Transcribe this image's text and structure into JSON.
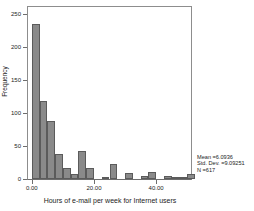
{
  "chart_data": {
    "type": "bar",
    "title": "",
    "subtitle": "",
    "xlabel": "Hours of e-mail per week for Internet users",
    "ylabel": "Frequency",
    "xlim": [
      -1.25,
      51.25
    ],
    "ylim": [
      0,
      260
    ],
    "grid": false,
    "legend": null,
    "bin_width": 2.5,
    "x_tick_labels": [
      "0.00",
      "20.00",
      "40.00"
    ],
    "x_tick_values": [
      0,
      20,
      40
    ],
    "y_tick_labels": [
      "0",
      "50",
      "100",
      "150",
      "200",
      "250"
    ],
    "y_tick_values": [
      0,
      50,
      100,
      150,
      200,
      250
    ],
    "categories": [
      "0.0",
      "2.5",
      "5.0",
      "7.5",
      "10.0",
      "12.5",
      "15.0",
      "17.5",
      "20.0",
      "22.5",
      "25.0",
      "27.5",
      "30.0",
      "32.5",
      "35.0",
      "37.5",
      "40.0",
      "42.5",
      "45.0",
      "47.5",
      "50.0"
    ],
    "bin_centers": [
      1.25,
      3.75,
      6.25,
      8.75,
      11.25,
      13.75,
      16.25,
      18.75,
      21.25,
      23.75,
      26.25,
      28.75,
      31.25,
      33.75,
      36.25,
      38.75,
      41.25,
      43.75,
      46.25,
      48.75,
      51.25
    ],
    "values": [
      234,
      118,
      88,
      38,
      16,
      7,
      42,
      16,
      0,
      2,
      23,
      0,
      9,
      0,
      5,
      10,
      0,
      5,
      2,
      2,
      8
    ],
    "annotations": [
      "Mean =6.0936",
      "Std. Dev. =9.09251",
      "N =617"
    ],
    "statistics": {
      "mean_label": "Mean =6.0936",
      "mean": 6.0936,
      "std_dev_label": "Std. Dev. =9.09251",
      "std_dev": 9.09251,
      "n_label": "N =617",
      "n": 617
    },
    "colors": {
      "bar_fill": "#8a8a8a",
      "bar_stroke": "#5b5b5b",
      "axis": "#6e6e6e",
      "text": "#1c1c1c",
      "background": "#ffffff"
    }
  }
}
